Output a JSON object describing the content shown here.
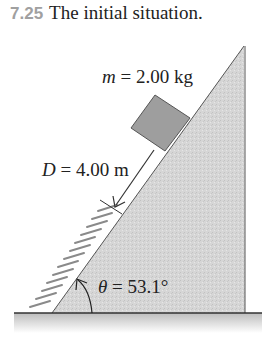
{
  "figure": {
    "number": "7.25",
    "caption": "The initial situation."
  },
  "labels": {
    "mass_symbol": "m",
    "mass_eq": " = 2.00 kg",
    "distance_symbol": "D",
    "distance_eq": " = 4.00 m",
    "angle_symbol": "θ",
    "angle_eq": " = 53.1°"
  },
  "quantities": {
    "mass": {
      "value": 2.0,
      "unit": "kg"
    },
    "distance": {
      "value": 4.0,
      "unit": "m"
    },
    "angle": {
      "value": 53.1,
      "unit": "°"
    }
  },
  "colors": {
    "incline_fill": "#d4d4d4",
    "block_fill": "#9e9e9e",
    "line": "#333333",
    "spring": "#8a8a8a",
    "caption_number": "#a0a0a0"
  }
}
